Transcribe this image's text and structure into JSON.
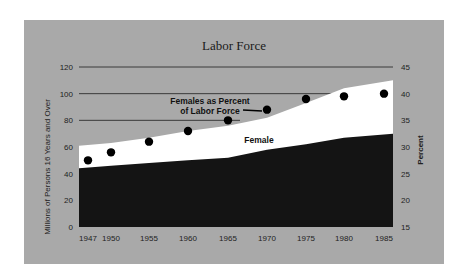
{
  "chart_data": {
    "type": "area",
    "title": "Labor Force",
    "xlabel": "",
    "ylabel": "Millions of Persons 16 Years and Over",
    "y2label": "Percent",
    "x_ticks": [
      "1947",
      "1950",
      "1955",
      "1960",
      "1965",
      "1970",
      "1975",
      "1980",
      "1985"
    ],
    "y_ticks": [
      "0",
      "20",
      "40",
      "60",
      "80",
      "100",
      "120"
    ],
    "y2_ticks": [
      "15",
      "20",
      "25",
      "30",
      "35",
      "40",
      "45"
    ],
    "ylim": [
      0,
      120
    ],
    "y2lim": [
      15,
      45
    ],
    "grid": "horizontal lines at 80, 100, 120",
    "x": [
      1947,
      1950,
      1955,
      1960,
      1965,
      1970,
      1975,
      1980,
      1985
    ],
    "series": [
      {
        "name": "Male",
        "kind": "area",
        "color": "#141414",
        "values": [
          44,
          46,
          48,
          50,
          52,
          58,
          62,
          67,
          70
        ]
      },
      {
        "name": "Total Labor Force (Female stacked on Male)",
        "kind": "area",
        "color": "#ffffff",
        "values": [
          61,
          63,
          67,
          72,
          76,
          82,
          93,
          104,
          110
        ]
      },
      {
        "name": "Females as Percent of Labor Force",
        "kind": "scatter",
        "axis": "right",
        "color": "#000000",
        "values": [
          27.5,
          29,
          31,
          33,
          35,
          37,
          39,
          39.5,
          40
        ]
      }
    ],
    "annotations": [
      "Female",
      "Females as Percent of Labor Force"
    ]
  },
  "labels": {
    "title": "Labor Force",
    "female_area": "Female",
    "pct_line1": "Females as Percent",
    "pct_line2": "of Labor Force",
    "ylabel": "Millions of Persons 16 Years and Over",
    "y2label": "Percent"
  },
  "colors": {
    "panel": "#a9a9a9",
    "male": "#141414",
    "female": "#ffffff",
    "dot": "#000000",
    "grid": "#3a3a3a"
  }
}
